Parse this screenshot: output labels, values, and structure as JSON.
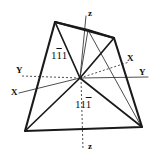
{
  "figure": {
    "background_color": "#ffffff",
    "line_color": "#1a1a1a",
    "axis_color": "#3a3a3a",
    "width": 155,
    "height": 160
  },
  "axes": [
    {
      "name": "z-axis-top",
      "label": "z",
      "x": 88,
      "y": 9,
      "style": "solid"
    },
    {
      "name": "z-axis-bottom",
      "label": "z",
      "x": 88,
      "y": 142,
      "style": "dashed"
    },
    {
      "name": "y-axis-left",
      "label": "Y",
      "x": 16,
      "y": 66,
      "style": "dashed"
    },
    {
      "name": "y-axis-right",
      "label": "Y",
      "x": 139,
      "y": 68,
      "style": "solid"
    },
    {
      "name": "x-axis-lower-left",
      "label": "X",
      "x": 11,
      "y": 88,
      "style": "solid"
    },
    {
      "name": "x-axis-upper-right",
      "label": "X",
      "x": 127,
      "y": 54,
      "style": "dashed"
    }
  ],
  "face_labels": [
    {
      "name": "face-label-upper",
      "pre": "1",
      "bar": "1",
      "post": "1",
      "x": 51,
      "y": 50
    },
    {
      "name": "face-label-lower",
      "pre": "11",
      "bar": "1",
      "post": "",
      "x": 75,
      "y": 99
    }
  ],
  "geometry": {
    "origin": {
      "x": 80,
      "y": 78
    },
    "outline_points": "55,22 114,38 142,127 25,131",
    "internal_lines": [
      {
        "name": "edge-topleft-to-origin",
        "x1": 55,
        "y1": 22,
        "x2": 80,
        "y2": 78
      },
      {
        "name": "edge-origin-to-bottomleft",
        "x1": 80,
        "y1": 78,
        "x2": 25,
        "y2": 131
      },
      {
        "name": "edge-topright-to-origin",
        "x1": 114,
        "y1": 38,
        "x2": 80,
        "y2": 78
      },
      {
        "name": "edge-origin-to-bottomright",
        "x1": 80,
        "y1": 78,
        "x2": 142,
        "y2": 127
      },
      {
        "name": "edge-topleft-to-topcenter",
        "x1": 55,
        "y1": 22,
        "x2": 88,
        "y2": 30
      },
      {
        "name": "edge-topcenter-to-topright",
        "x1": 88,
        "y1": 30,
        "x2": 114,
        "y2": 38
      }
    ],
    "thin_lines": [
      {
        "name": "thin-topcenter-to-origin",
        "x1": 88,
        "y1": 30,
        "x2": 80,
        "y2": 78
      },
      {
        "name": "thin-origin-to-bottomright",
        "x1": 80,
        "y1": 78,
        "x2": 142,
        "y2": 127
      }
    ]
  }
}
